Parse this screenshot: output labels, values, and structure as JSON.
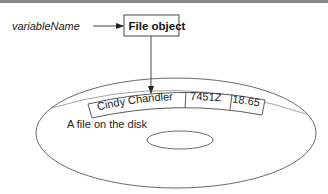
{
  "diagram": {
    "variable_label": "variableName",
    "object_box_label": "File object",
    "disk_label": "A file on the disk",
    "record": {
      "fields": [
        {
          "name": "name",
          "value": "Cindy Chandler"
        },
        {
          "name": "id",
          "value": "7451Z"
        },
        {
          "name": "amount",
          "value": "18.65"
        }
      ]
    },
    "edges": [
      {
        "from": "variableName",
        "to": "File object",
        "type": "arrow"
      },
      {
        "from": "File object",
        "to": "A file on the disk",
        "type": "arrow"
      }
    ],
    "colors": {
      "stroke": "#333333",
      "text": "#222222",
      "background": "#ffffff"
    }
  }
}
